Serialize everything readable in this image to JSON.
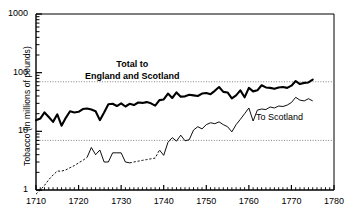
{
  "chart_data": {
    "type": "line",
    "title": "",
    "xlabel": "",
    "ylabel": "Tobacco (in millions of pounds)",
    "xlim": [
      1710,
      1780
    ],
    "ylim": [
      1,
      1000
    ],
    "yscale": "log",
    "grid": "horizontal dotted gridlines at 70 and 7",
    "gridlines": [
      70,
      7
    ],
    "ytick_labels": [
      "1",
      "10",
      "100",
      "1000"
    ],
    "ytick_values": [
      1,
      10,
      100,
      1000
    ],
    "xtick_labels": [
      "1710",
      "1720",
      "1730",
      "1740",
      "1750",
      "1760",
      "1770",
      "1780"
    ],
    "xtick_values": [
      1710,
      1720,
      1730,
      1740,
      1750,
      1760,
      1770,
      1780
    ],
    "minor_xticks": "every 1 year",
    "legend": "inline annotations",
    "annotations": [
      {
        "name": "total-label",
        "line1": "Total to",
        "line2": "England and Scotland",
        "weight": "bold"
      },
      {
        "name": "scotland-label",
        "text": "To Scotland",
        "weight": "normal"
      }
    ],
    "series": [
      {
        "name": "Total to England and Scotland",
        "style": "solid-bold",
        "x": [
          1710,
          1711,
          1712,
          1713,
          1714,
          1715,
          1716,
          1717,
          1718,
          1719,
          1720,
          1721,
          1722,
          1723,
          1724,
          1725,
          1726,
          1727,
          1728,
          1729,
          1730,
          1731,
          1732,
          1733,
          1734,
          1735,
          1736,
          1737,
          1738,
          1739,
          1740,
          1741,
          1742,
          1743,
          1744,
          1745,
          1746,
          1747,
          1748,
          1749,
          1750,
          1751,
          1752,
          1753,
          1754,
          1755,
          1756,
          1757,
          1758,
          1759,
          1760,
          1761,
          1762,
          1763,
          1764,
          1765,
          1766,
          1767,
          1768,
          1769,
          1770,
          1771,
          1772,
          1773,
          1774,
          1775
        ],
        "values": [
          15.5,
          16.5,
          21.0,
          17.5,
          14.5,
          19.5,
          12.5,
          17.0,
          22.0,
          21.0,
          21.5,
          24.0,
          24.5,
          23.5,
          22.0,
          15.5,
          21.0,
          29.0,
          29.5,
          27.0,
          30.0,
          26.5,
          29.5,
          28.0,
          31.0,
          30.5,
          31.5,
          30.0,
          27.5,
          34.0,
          35.0,
          44.0,
          37.0,
          46.0,
          39.0,
          39.5,
          42.0,
          41.0,
          40.0,
          44.0,
          45.0,
          43.0,
          49.0,
          57.0,
          47.0,
          46.0,
          36.5,
          41.0,
          50.0,
          38.0,
          55.0,
          48.0,
          50.0,
          61.0,
          56.0,
          55.0,
          53.0,
          56.0,
          57.0,
          55.0,
          60.0,
          72.0,
          64.0,
          67.0,
          68.0,
          76.0
        ]
      },
      {
        "name": "To Scotland",
        "style": "solid-thin with dashed interpolated segments",
        "dashed_ranges": [
          [
            1710,
            1722
          ],
          [
            1732,
            1739
          ]
        ],
        "x": [
          1710,
          1711,
          1712,
          1713,
          1714,
          1715,
          1716,
          1717,
          1718,
          1719,
          1720,
          1721,
          1722,
          1723,
          1724,
          1725,
          1726,
          1727,
          1728,
          1729,
          1730,
          1731,
          1732,
          1733,
          1734,
          1735,
          1736,
          1737,
          1738,
          1739,
          1740,
          1741,
          1742,
          1743,
          1744,
          1745,
          1746,
          1747,
          1748,
          1749,
          1750,
          1751,
          1752,
          1753,
          1754,
          1755,
          1756,
          1757,
          1758,
          1759,
          1760,
          1761,
          1762,
          1763,
          1764,
          1765,
          1766,
          1767,
          1768,
          1769,
          1770,
          1771,
          1772,
          1773,
          1774,
          1775
        ],
        "values": [
          0.85,
          1.0,
          1.2,
          1.5,
          1.8,
          2.1,
          2.1,
          2.2,
          2.4,
          2.6,
          2.9,
          3.2,
          3.6,
          5.3,
          4.0,
          4.8,
          3.0,
          3.0,
          4.3,
          4.3,
          4.3,
          3.0,
          2.9,
          3.0,
          3.1,
          3.2,
          3.3,
          3.4,
          3.5,
          4.8,
          3.9,
          6.5,
          7.8,
          6.8,
          8.6,
          6.9,
          7.2,
          10.5,
          12.0,
          11.0,
          13.0,
          14.0,
          13.5,
          14.5,
          13.0,
          12.0,
          9.8,
          13.0,
          16.0,
          20.0,
          25.0,
          15.0,
          23.0,
          24.0,
          23.5,
          26.0,
          25.0,
          27.0,
          26.5,
          28.0,
          31.0,
          38.0,
          34.0,
          33.0,
          36.0,
          33.0
        ]
      }
    ]
  }
}
